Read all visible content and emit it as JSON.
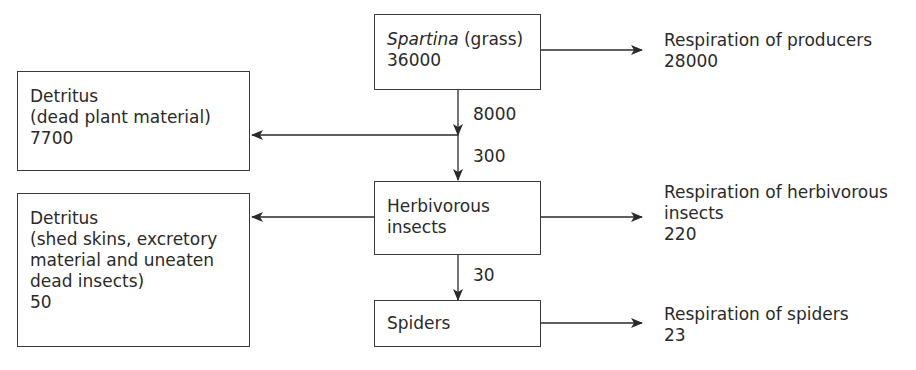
{
  "diagram": {
    "type": "energy-flow",
    "nodes": {
      "spartina": {
        "name_italic": "Spartina",
        "name_rest": " (grass)",
        "value": "36000"
      },
      "detritus_plant": {
        "title": "Detritus",
        "desc": "(dead plant material)",
        "value": "7700"
      },
      "herbivores": {
        "line1": "Herbivorous",
        "line2": "insects"
      },
      "detritus_insects": {
        "title": "Detritus",
        "desc1": "(shed skins, excretory",
        "desc2": "material and uneaten",
        "desc3": "dead insects)",
        "value": "50"
      },
      "spiders": {
        "name": "Spiders"
      }
    },
    "outputs": {
      "resp_producers": {
        "label": "Respiration of producers",
        "value": "28000"
      },
      "resp_herbivores": {
        "line1": "Respiration of herbivorous",
        "line2": "insects",
        "value": "220"
      },
      "resp_spiders": {
        "label": "Respiration of spiders",
        "value": "23"
      }
    },
    "flows": {
      "spartina_out": "8000",
      "to_herbivores": "300",
      "to_spiders": "30"
    }
  }
}
